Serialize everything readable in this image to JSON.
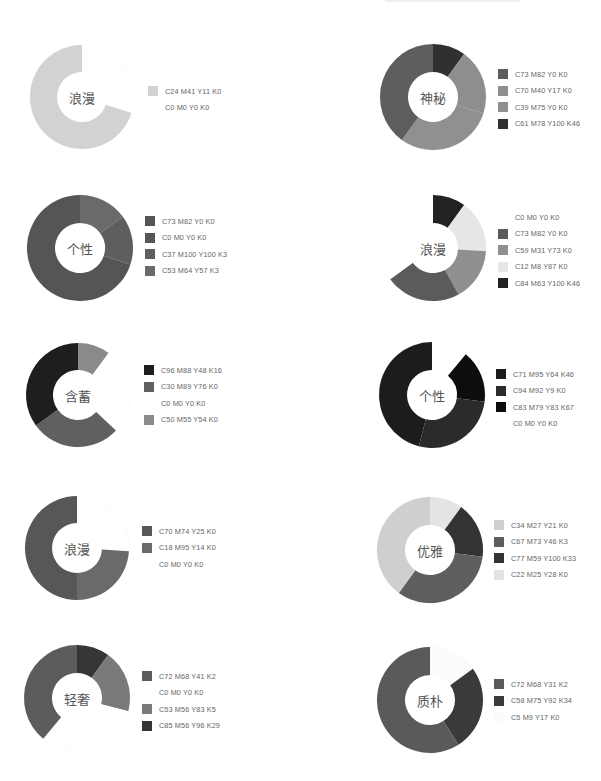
{
  "page": {
    "title": ""
  },
  "chart_data": [
    {
      "type": "pie",
      "variant": "donut",
      "title": "浪漫",
      "center": [
        82,
        97
      ],
      "outer_r": 52,
      "inner_r": 25,
      "legend_pos": [
        148,
        83
      ],
      "slices": [
        {
          "label": "C0  M0  Y0  K0",
          "value": 30,
          "color": "#ffffff"
        },
        {
          "label": "C24 M41 Y11 K0",
          "value": 70,
          "color": "#d2d2d2"
        }
      ],
      "legend": [
        {
          "label": "C24 M41 Y11 K0",
          "color": "#d2d2d2"
        },
        {
          "label": "C0  M0  Y0  K0",
          "color": "#ffffff"
        }
      ]
    },
    {
      "type": "pie",
      "variant": "donut",
      "title": "神秘",
      "center": [
        433,
        97
      ],
      "outer_r": 53,
      "inner_r": 25,
      "legend_pos": [
        498,
        66
      ],
      "slices": [
        {
          "label": "C61 M78 Y100 K46",
          "value": 10,
          "color": "#303030"
        },
        {
          "label": "C70 M40 Y17 K0",
          "value": 20,
          "color": "#8e8e8e"
        },
        {
          "label": "C39 M75 Y0 K0",
          "value": 30,
          "color": "#909090"
        },
        {
          "label": "C73 M82 Y0 K0",
          "value": 40,
          "color": "#5d5d5d"
        }
      ],
      "legend": [
        {
          "label": "C73 M82 Y0 K0",
          "color": "#5d5d5d"
        },
        {
          "label": "C70 M40 Y17 K0",
          "color": "#8e8e8e"
        },
        {
          "label": "C39 M75 Y0 K0",
          "color": "#909090"
        },
        {
          "label": "C61 M78 Y100 K46",
          "color": "#303030"
        }
      ]
    },
    {
      "type": "pie",
      "variant": "donut",
      "title": "个性",
      "center": [
        80,
        248
      ],
      "outer_r": 53,
      "inner_r": 25,
      "legend_pos": [
        145,
        213
      ],
      "slices": [
        {
          "label": "C53 M64 Y57 K3",
          "value": 15,
          "color": "#6a6a6a"
        },
        {
          "label": "C37 M100 Y100 K3",
          "value": 15,
          "color": "#5e5e5e"
        },
        {
          "label": "C73 M82 Y0 K0",
          "value": 70,
          "color": "#555555"
        }
      ],
      "legend": [
        {
          "label": "C73 M82 Y0 K0",
          "color": "#555555"
        },
        {
          "label": "C0  M0  Y0  K0",
          "color": "#555555"
        },
        {
          "label": "C37 M100 Y100 K3",
          "color": "#5e5e5e"
        },
        {
          "label": "C53 M64 Y57 K3",
          "color": "#6a6a6a"
        }
      ]
    },
    {
      "type": "pie",
      "variant": "donut",
      "title": "浪漫",
      "center": [
        433,
        248
      ],
      "outer_r": 53,
      "inner_r": 25,
      "legend_pos": [
        498,
        209
      ],
      "slices": [
        {
          "label": "C84 M63 Y100 K46",
          "value": 10,
          "color": "#222222"
        },
        {
          "label": "C12 M8 Y87 K0",
          "value": 16,
          "color": "#e6e6e6"
        },
        {
          "label": "C59 M31 Y73 K0",
          "value": 16,
          "color": "#8f8f8f"
        },
        {
          "label": "C73 M82 Y0 K0",
          "value": 23,
          "color": "#5b5b5b"
        },
        {
          "label": "C0  M0  Y0  K0",
          "value": 35,
          "color": "#ffffff"
        }
      ],
      "legend": [
        {
          "label": "C0  M0  Y0  K0",
          "color": "#ffffff"
        },
        {
          "label": "C73 M82 Y0 K0",
          "color": "#5b5b5b"
        },
        {
          "label": "C59 M31 Y73 K0",
          "color": "#8f8f8f"
        },
        {
          "label": "C12 M8 Y87 K0",
          "color": "#e6e6e6"
        },
        {
          "label": "C84 M63 Y100 K46",
          "color": "#222222"
        }
      ]
    },
    {
      "type": "pie",
      "variant": "donut",
      "title": "含蓄",
      "center": [
        78,
        395
      ],
      "outer_r": 52,
      "inner_r": 25,
      "legend_pos": [
        144,
        362
      ],
      "slices": [
        {
          "label": "C50 M55 Y54 K0",
          "value": 10,
          "color": "#8a8a8a"
        },
        {
          "label": "C0  M0  Y0  K0",
          "value": 27,
          "color": "#ffffff"
        },
        {
          "label": "C30 M89 Y76 K0",
          "value": 28,
          "color": "#606060"
        },
        {
          "label": "C96 M88 Y48 K16",
          "value": 35,
          "color": "#1e1e1e"
        }
      ],
      "legend": [
        {
          "label": "C96 M88 Y48 K16",
          "color": "#1e1e1e"
        },
        {
          "label": "C30 M89 Y76 K0",
          "color": "#606060"
        },
        {
          "label": "C0  M0  Y0  K0",
          "color": "#ffffff"
        },
        {
          "label": "C50 M55 Y54 K0",
          "color": "#8a8a8a"
        }
      ]
    },
    {
      "type": "pie",
      "variant": "donut",
      "title": "个性",
      "center": [
        432,
        395
      ],
      "outer_r": 53,
      "inner_r": 25,
      "legend_pos": [
        496,
        366
      ],
      "slices": [
        {
          "label": "C0  M0  Y0  K0",
          "value": 11,
          "color": "#ffffff"
        },
        {
          "label": "C83 M79 Y83 K67",
          "value": 16,
          "color": "#0d0d0d"
        },
        {
          "label": "C94 M92 Y9 K0",
          "value": 27,
          "color": "#2b2b2b"
        },
        {
          "label": "C71 M95 Y64 K46",
          "value": 46,
          "color": "#1c1c1c"
        }
      ],
      "legend": [
        {
          "label": "C71 M95 Y64 K46",
          "color": "#1c1c1c"
        },
        {
          "label": "C94 M92 Y9 K0",
          "color": "#2b2b2b"
        },
        {
          "label": "C83 M79 Y83 K67",
          "color": "#0d0d0d"
        },
        {
          "label": "C0  M0  Y0  K0",
          "color": "#ffffff"
        }
      ]
    },
    {
      "type": "pie",
      "variant": "donut",
      "title": "浪漫",
      "center": [
        77,
        548
      ],
      "outer_r": 52,
      "inner_r": 25,
      "legend_pos": [
        142,
        523
      ],
      "slices": [
        {
          "label": "C0  M0  Y0  K0",
          "value": 26,
          "color": "#ffffff"
        },
        {
          "label": "C18 M95 Y14 K0",
          "value": 24,
          "color": "#6a6a6a"
        },
        {
          "label": "C70 M74 Y25 K0",
          "value": 50,
          "color": "#575757"
        }
      ],
      "legend": [
        {
          "label": "C70 M74 Y25 K0",
          "color": "#575757"
        },
        {
          "label": "C18 M95 Y14 K0",
          "color": "#6a6a6a"
        },
        {
          "label": "C0  M0  Y0  K0",
          "color": "#ffffff"
        }
      ]
    },
    {
      "type": "pie",
      "variant": "donut",
      "title": "优雅",
      "center": [
        430,
        550
      ],
      "outer_r": 53,
      "inner_r": 25,
      "legend_pos": [
        494,
        517
      ],
      "slices": [
        {
          "label": "C22 M25 Y28 K0",
          "value": 10,
          "color": "#e4e4e4"
        },
        {
          "label": "C77 M59 Y100 K33",
          "value": 17,
          "color": "#333333"
        },
        {
          "label": "C67 M73 Y46 K3",
          "value": 33,
          "color": "#5e5e5e"
        },
        {
          "label": "C34 M27 Y21 K0",
          "value": 40,
          "color": "#cfcfcf"
        }
      ],
      "legend": [
        {
          "label": "C34 M27 Y21 K0",
          "color": "#cfcfcf"
        },
        {
          "label": "C67 M73 Y46 K3",
          "color": "#5e5e5e"
        },
        {
          "label": "C77 M59 Y100 K33",
          "color": "#333333"
        },
        {
          "label": "C22 M25 Y28 K0",
          "color": "#e4e4e4"
        }
      ]
    },
    {
      "type": "pie",
      "variant": "donut",
      "title": "轻奢",
      "center": [
        77,
        698
      ],
      "outer_r": 53,
      "inner_r": 25,
      "legend_pos": [
        142,
        668
      ],
      "slices": [
        {
          "label": "C85 M56 Y96 K29",
          "value": 10,
          "color": "#363636"
        },
        {
          "label": "C53 M56 Y83 K5",
          "value": 19,
          "color": "#7a7a7a"
        },
        {
          "label": "C0  M0  Y0  K0",
          "value": 32,
          "color": "#ffffff"
        },
        {
          "label": "C72 M68 Y41 K2",
          "value": 39,
          "color": "#5c5c5c"
        }
      ],
      "legend": [
        {
          "label": "C72 M68 Y41 K2",
          "color": "#5c5c5c"
        },
        {
          "label": "C0  M0  Y0  K0",
          "color": "#ffffff"
        },
        {
          "label": "C53 M56 Y83 K5",
          "color": "#7a7a7a"
        },
        {
          "label": "C85 M56 Y96 K29",
          "color": "#363636"
        }
      ]
    },
    {
      "type": "pie",
      "variant": "donut",
      "title": "质朴",
      "center": [
        430,
        700
      ],
      "outer_r": 53,
      "inner_r": 25,
      "legend_pos": [
        494,
        676
      ],
      "slices": [
        {
          "label": "C5 M9 Y17 K0",
          "value": 15,
          "color": "#fbfbfb"
        },
        {
          "label": "C58 M75 Y92 K34",
          "value": 26,
          "color": "#3a3a3a"
        },
        {
          "label": "C72 M68 Y31 K2",
          "value": 59,
          "color": "#5a5a5a"
        }
      ],
      "legend": [
        {
          "label": "C72 M68 Y31 K2",
          "color": "#5a5a5a"
        },
        {
          "label": "C58 M75 Y92 K34",
          "color": "#3a3a3a"
        },
        {
          "label": "C5 M9 Y17 K0",
          "color": "#fbfbfb"
        }
      ]
    }
  ]
}
